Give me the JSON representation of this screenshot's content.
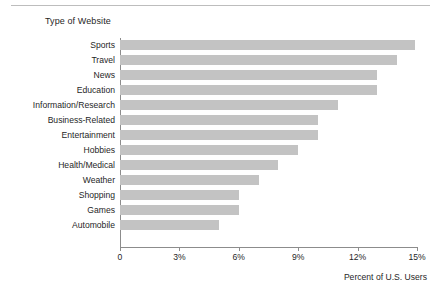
{
  "chart_data": {
    "type": "bar",
    "orientation": "horizontal",
    "title": "",
    "ylabel": "Type of Website",
    "xlabel": "Percent of U.S. Users",
    "categories": [
      "Sports",
      "Travel",
      "News",
      "Education",
      "Information/Research",
      "Business-Related",
      "Entertainment",
      "Hobbies",
      "Health/Medical",
      "Weather",
      "Shopping",
      "Games",
      "Automobile"
    ],
    "values": [
      14.9,
      14.0,
      13.0,
      13.0,
      11.0,
      10.0,
      10.0,
      9.0,
      8.0,
      7.0,
      6.0,
      6.0,
      5.0
    ],
    "xlim": [
      0,
      15
    ],
    "xticks": [
      0,
      3,
      6,
      9,
      12,
      15
    ],
    "xtick_labels": [
      "0",
      "3%",
      "6%",
      "9%",
      "12%",
      "15%"
    ],
    "grid": false,
    "legend": null,
    "bar_color": "#c3c3c3",
    "axis_color": "#8c8c8c"
  }
}
